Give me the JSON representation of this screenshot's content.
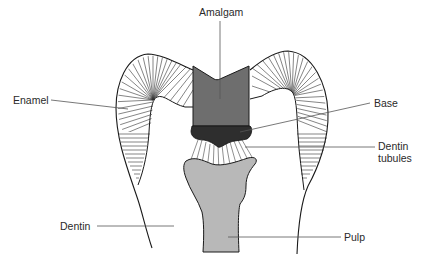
{
  "diagram": {
    "labels": {
      "amalgam": "Amalgam",
      "enamel": "Enamel",
      "base": "Base",
      "dentin_tubules_line1": "Dentin",
      "dentin_tubules_line2": "tubules",
      "dentin": "Dentin",
      "pulp": "Pulp"
    },
    "colors": {
      "outline": "#1a1a1a",
      "amalgam": "#6e6e6e",
      "base": "#2e2e2e",
      "pulp": "#b8b8b8",
      "leader_line": "#555555",
      "background": "#ffffff"
    }
  }
}
